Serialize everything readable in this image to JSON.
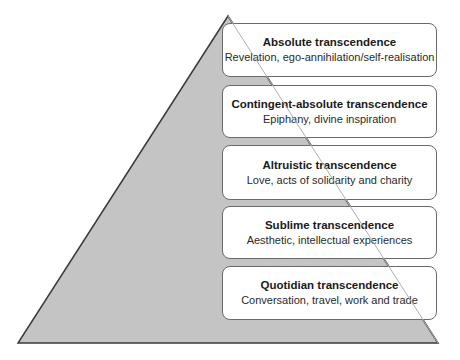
{
  "diagram": {
    "type": "pyramid",
    "colors": {
      "pyramid_fill": "#c4c4c4",
      "pyramid_stroke": "#3a3a3a",
      "box_fill": "#ffffff",
      "box_border": "#6a6a6a"
    },
    "levels": [
      {
        "title": "Absolute transcendence",
        "description": "Revelation, ego-annihilation/self-realisation"
      },
      {
        "title": "Contingent-absolute transcendence",
        "description": "Epiphany, divine inspiration"
      },
      {
        "title": "Altruistic transcendence",
        "description": "Love, acts of solidarity and charity"
      },
      {
        "title": "Sublime transcendence",
        "description": "Aesthetic, intellectual experiences"
      },
      {
        "title": "Quotidian transcendence",
        "description": "Conversation, travel, work and trade"
      }
    ]
  }
}
